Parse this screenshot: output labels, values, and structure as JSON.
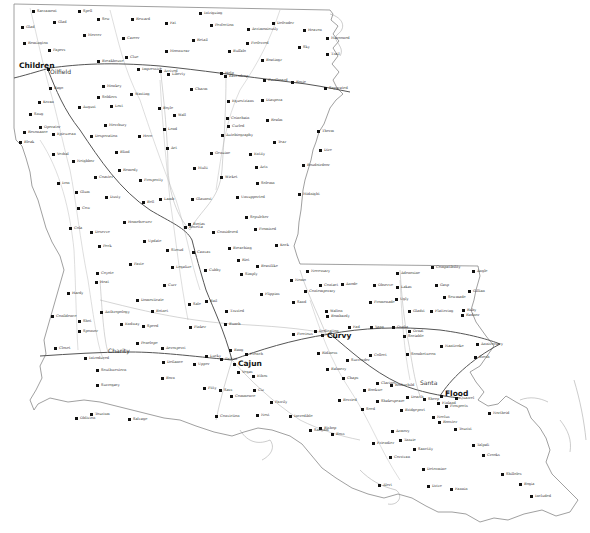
{
  "map": {
    "type": "state outline map with cities and roads",
    "colors": {
      "background": "#ffffff",
      "border": "#888888",
      "road_major": "#555555",
      "road_minor": "#bbbbbb",
      "water": "#999999",
      "dot": "#111111"
    },
    "major_cities": [
      {
        "name": "Children",
        "x": 47,
        "y": 68
      },
      {
        "name": "Curvy",
        "x": 327,
        "y": 338
      },
      {
        "name": "Cajun",
        "x": 233,
        "y": 363
      },
      {
        "name": "Flood",
        "x": 442,
        "y": 395
      }
    ],
    "medium_cities": [
      {
        "name": "Oilfield",
        "x": 50,
        "y": 72
      },
      {
        "name": "Charity",
        "x": 108,
        "y": 352
      },
      {
        "name": "Santa",
        "x": 425,
        "y": 386
      }
    ],
    "cities": [
      {
        "name": "Sacrament",
        "x": 33,
        "y": 11
      },
      {
        "name": "Spell",
        "x": 79,
        "y": 11
      },
      {
        "name": "Glad",
        "x": 54,
        "y": 22
      },
      {
        "name": "Sew",
        "x": 98,
        "y": 19
      },
      {
        "name": "Reward",
        "x": 132,
        "y": 19
      },
      {
        "name": "Fat",
        "x": 166,
        "y": 23
      },
      {
        "name": "Intriguing",
        "x": 200,
        "y": 13
      },
      {
        "name": "Perfection",
        "x": 211,
        "y": 25
      },
      {
        "name": "Acrimoniously",
        "x": 248,
        "y": 29
      },
      {
        "name": "Defender",
        "x": 273,
        "y": 23
      },
      {
        "name": "Heaven",
        "x": 304,
        "y": 30
      },
      {
        "name": "Glad",
        "x": 22,
        "y": 27
      },
      {
        "name": "Retail",
        "x": 193,
        "y": 40
      },
      {
        "name": "Marooned",
        "x": 327,
        "y": 38
      },
      {
        "name": "Remington",
        "x": 24,
        "y": 43
      },
      {
        "name": "Mercer",
        "x": 84,
        "y": 35
      },
      {
        "name": "Career",
        "x": 123,
        "y": 38
      },
      {
        "name": "Preferred",
        "x": 247,
        "y": 43
      },
      {
        "name": "Sky",
        "x": 299,
        "y": 47
      },
      {
        "name": "Trail",
        "x": 327,
        "y": 54
      },
      {
        "name": "Papers",
        "x": 49,
        "y": 50
      },
      {
        "name": "Moonwear",
        "x": 166,
        "y": 51
      },
      {
        "name": "Buffalo",
        "x": 229,
        "y": 51
      },
      {
        "name": "Boatingr",
        "x": 262,
        "y": 60
      },
      {
        "name": "Clue",
        "x": 126,
        "y": 57
      },
      {
        "name": "Breakhouse",
        "x": 98,
        "y": 61
      },
      {
        "name": "Impressive",
        "x": 138,
        "y": 69
      },
      {
        "name": "Arrived",
        "x": 160,
        "y": 71
      },
      {
        "name": "Liberty",
        "x": 168,
        "y": 74
      },
      {
        "name": "Help",
        "x": 221,
        "y": 73
      },
      {
        "name": "Eavesdrop",
        "x": 225,
        "y": 76
      },
      {
        "name": "Cardboard",
        "x": 264,
        "y": 80
      },
      {
        "name": "Rosie",
        "x": 292,
        "y": 82
      },
      {
        "name": "Separated",
        "x": 325,
        "y": 88
      },
      {
        "name": "Monkey",
        "x": 103,
        "y": 86
      },
      {
        "name": "Charm",
        "x": 191,
        "y": 89
      },
      {
        "name": "Bago",
        "x": 50,
        "y": 88
      },
      {
        "name": "Soldiers",
        "x": 98,
        "y": 97
      },
      {
        "name": "Wasting",
        "x": 131,
        "y": 94
      },
      {
        "name": "Equestrians",
        "x": 228,
        "y": 101
      },
      {
        "name": "Diaspora",
        "x": 262,
        "y": 100
      },
      {
        "name": "Koran",
        "x": 39,
        "y": 102
      },
      {
        "name": "Lost",
        "x": 111,
        "y": 106
      },
      {
        "name": "August",
        "x": 79,
        "y": 107
      },
      {
        "name": "Boyle",
        "x": 159,
        "y": 108
      },
      {
        "name": "Wall",
        "x": 174,
        "y": 115
      },
      {
        "name": "Snug",
        "x": 30,
        "y": 114
      },
      {
        "name": "Merrbury",
        "x": 105,
        "y": 125
      },
      {
        "name": "Coinchain",
        "x": 227,
        "y": 118
      },
      {
        "name": "Realm",
        "x": 267,
        "y": 120
      },
      {
        "name": "Operator",
        "x": 40,
        "y": 127
      },
      {
        "name": "Lend",
        "x": 164,
        "y": 129
      },
      {
        "name": "Curled",
        "x": 228,
        "y": 126
      },
      {
        "name": "Resonance",
        "x": 24,
        "y": 132
      },
      {
        "name": "Epicurean",
        "x": 53,
        "y": 134
      },
      {
        "name": "Desperation",
        "x": 91,
        "y": 136
      },
      {
        "name": "Hero",
        "x": 139,
        "y": 136
      },
      {
        "name": "Autobiography",
        "x": 222,
        "y": 135
      },
      {
        "name": "Tear",
        "x": 274,
        "y": 142
      },
      {
        "name": "Therm",
        "x": 318,
        "y": 131
      },
      {
        "name": "Bleak",
        "x": 20,
        "y": 142
      },
      {
        "name": "Blind",
        "x": 116,
        "y": 152
      },
      {
        "name": "Act",
        "x": 167,
        "y": 148
      },
      {
        "name": "Genuine",
        "x": 211,
        "y": 153
      },
      {
        "name": "Entity",
        "x": 250,
        "y": 154
      },
      {
        "name": "Dire",
        "x": 320,
        "y": 150
      },
      {
        "name": "Verbal",
        "x": 53,
        "y": 154
      },
      {
        "name": "Neighbor",
        "x": 73,
        "y": 161
      },
      {
        "name": "Remedy",
        "x": 119,
        "y": 170
      },
      {
        "name": "Multi",
        "x": 194,
        "y": 168
      },
      {
        "name": "Arts",
        "x": 256,
        "y": 167
      },
      {
        "name": "Boudoirdoor",
        "x": 303,
        "y": 165
      },
      {
        "name": "Coaster",
        "x": 95,
        "y": 177
      },
      {
        "name": "Prosperity",
        "x": 140,
        "y": 180
      },
      {
        "name": "Wicket",
        "x": 221,
        "y": 177
      },
      {
        "name": "Solemn",
        "x": 257,
        "y": 183
      },
      {
        "name": "Iron",
        "x": 58,
        "y": 183
      },
      {
        "name": "Glum",
        "x": 76,
        "y": 192
      },
      {
        "name": "Midnight",
        "x": 299,
        "y": 194
      },
      {
        "name": "Dusty",
        "x": 106,
        "y": 197
      },
      {
        "name": "Bell",
        "x": 143,
        "y": 202
      },
      {
        "name": "Lamb",
        "x": 160,
        "y": 199
      },
      {
        "name": "Glasnost",
        "x": 192,
        "y": 199
      },
      {
        "name": "Unsupported",
        "x": 237,
        "y": 197
      },
      {
        "name": "Cow",
        "x": 78,
        "y": 208
      },
      {
        "name": "Homebrewer",
        "x": 124,
        "y": 222
      },
      {
        "name": "Cola",
        "x": 70,
        "y": 228
      },
      {
        "name": "Deserve",
        "x": 91,
        "y": 232
      },
      {
        "name": "Sepulcher",
        "x": 246,
        "y": 217
      },
      {
        "name": "Brotas",
        "x": 189,
        "y": 224
      },
      {
        "name": "Rosetta",
        "x": 185,
        "y": 227
      },
      {
        "name": "Considered",
        "x": 213,
        "y": 232
      },
      {
        "name": "Promised",
        "x": 255,
        "y": 229
      },
      {
        "name": "Peck",
        "x": 99,
        "y": 246
      },
      {
        "name": "Update",
        "x": 144,
        "y": 241
      },
      {
        "name": "Stroud",
        "x": 167,
        "y": 250
      },
      {
        "name": "Canvas",
        "x": 193,
        "y": 252
      },
      {
        "name": "Kock",
        "x": 276,
        "y": 245
      },
      {
        "name": "Breaching",
        "x": 229,
        "y": 248
      },
      {
        "name": "Riot",
        "x": 238,
        "y": 260
      },
      {
        "name": "Legalize",
        "x": 172,
        "y": 267
      },
      {
        "name": "Paste",
        "x": 130,
        "y": 264
      },
      {
        "name": "Cubby",
        "x": 205,
        "y": 270
      },
      {
        "name": "Beastlike",
        "x": 257,
        "y": 266
      },
      {
        "name": "Simply",
        "x": 241,
        "y": 274
      },
      {
        "name": "Coyote",
        "x": 97,
        "y": 273
      },
      {
        "name": "Heat",
        "x": 96,
        "y": 282
      },
      {
        "name": "Necessary",
        "x": 307,
        "y": 271
      },
      {
        "name": "Adenosine",
        "x": 397,
        "y": 273
      },
      {
        "name": "Compatibility",
        "x": 432,
        "y": 267
      },
      {
        "name": "Angle",
        "x": 473,
        "y": 271
      },
      {
        "name": "Nemo",
        "x": 291,
        "y": 280
      },
      {
        "name": "Contact",
        "x": 320,
        "y": 285
      },
      {
        "name": "Anode",
        "x": 342,
        "y": 284
      },
      {
        "name": "Observe",
        "x": 374,
        "y": 285
      },
      {
        "name": "Lakas",
        "x": 397,
        "y": 287
      },
      {
        "name": "Gasp",
        "x": 436,
        "y": 285
      },
      {
        "name": "Curr",
        "x": 164,
        "y": 285
      },
      {
        "name": "Hardy",
        "x": 68,
        "y": 293
      },
      {
        "name": "Contemporary",
        "x": 305,
        "y": 291
      },
      {
        "name": "Flippins",
        "x": 261,
        "y": 294
      },
      {
        "name": "Sewmade",
        "x": 444,
        "y": 297
      },
      {
        "name": "Gillian",
        "x": 469,
        "y": 291
      },
      {
        "name": "Domesticate",
        "x": 137,
        "y": 300
      },
      {
        "name": "Botnet",
        "x": 152,
        "y": 311
      },
      {
        "name": "Sale",
        "x": 189,
        "y": 304
      },
      {
        "name": "Bail",
        "x": 206,
        "y": 301
      },
      {
        "name": "Anthropology",
        "x": 101,
        "y": 312
      },
      {
        "name": "Sand",
        "x": 293,
        "y": 302
      },
      {
        "name": "Promenade",
        "x": 370,
        "y": 302
      },
      {
        "name": "Ugly",
        "x": 396,
        "y": 299
      },
      {
        "name": "Gladst",
        "x": 409,
        "y": 311
      },
      {
        "name": "Flattering",
        "x": 431,
        "y": 311
      },
      {
        "name": "Ruby",
        "x": 463,
        "y": 310
      },
      {
        "name": "Radnor",
        "x": 462,
        "y": 315
      },
      {
        "name": "Confidence",
        "x": 52,
        "y": 316
      },
      {
        "name": "Shot",
        "x": 79,
        "y": 321
      },
      {
        "name": "Walton",
        "x": 326,
        "y": 311
      },
      {
        "name": "Bombardy",
        "x": 327,
        "y": 316
      },
      {
        "name": "Endway",
        "x": 121,
        "y": 324
      },
      {
        "name": "Speed",
        "x": 143,
        "y": 326
      },
      {
        "name": "Pinker",
        "x": 190,
        "y": 327
      },
      {
        "name": "Trusted",
        "x": 226,
        "y": 311
      },
      {
        "name": "Sponsor",
        "x": 79,
        "y": 331
      },
      {
        "name": "Fad",
        "x": 349,
        "y": 327
      },
      {
        "name": "Yann",
        "x": 371,
        "y": 327
      },
      {
        "name": "Osaka",
        "x": 393,
        "y": 327
      },
      {
        "name": "Ornat",
        "x": 409,
        "y": 331
      },
      {
        "name": "Bunch",
        "x": 225,
        "y": 324
      },
      {
        "name": "Precious",
        "x": 293,
        "y": 334
      },
      {
        "name": "Dedication",
        "x": 315,
        "y": 331
      },
      {
        "name": "Sociable",
        "x": 404,
        "y": 336
      },
      {
        "name": "Anniversary",
        "x": 477,
        "y": 344
      },
      {
        "name": "Nanticoke",
        "x": 441,
        "y": 346
      },
      {
        "name": "Soonbetween",
        "x": 407,
        "y": 354
      },
      {
        "name": "Penelope",
        "x": 137,
        "y": 343
      },
      {
        "name": "Aerosperri",
        "x": 162,
        "y": 348
      },
      {
        "name": "Closet",
        "x": 55,
        "y": 348
      },
      {
        "name": "Bresh",
        "x": 475,
        "y": 357
      },
      {
        "name": "Ridiness",
        "x": 318,
        "y": 353
      },
      {
        "name": "Collect",
        "x": 370,
        "y": 355
      },
      {
        "name": "Surrender",
        "x": 347,
        "y": 360
      },
      {
        "name": "Introduced",
        "x": 85,
        "y": 358
      },
      {
        "name": "Bang",
        "x": 230,
        "y": 350
      },
      {
        "name": "French",
        "x": 246,
        "y": 354
      },
      {
        "name": "Lucky",
        "x": 206,
        "y": 356
      },
      {
        "name": "Patriot",
        "x": 221,
        "y": 359
      },
      {
        "name": "Defiance",
        "x": 163,
        "y": 362
      },
      {
        "name": "Upper",
        "x": 194,
        "y": 364
      },
      {
        "name": "Southwestern",
        "x": 97,
        "y": 370
      },
      {
        "name": "Balmery",
        "x": 327,
        "y": 369
      },
      {
        "name": "Vegas",
        "x": 238,
        "y": 372
      },
      {
        "name": "Ethos",
        "x": 253,
        "y": 376
      },
      {
        "name": "Chaps",
        "x": 343,
        "y": 378
      },
      {
        "name": "Born",
        "x": 162,
        "y": 378
      },
      {
        "name": "Clarinet",
        "x": 377,
        "y": 383
      },
      {
        "name": "Bookwe",
        "x": 364,
        "y": 390
      },
      {
        "name": "Rothschild",
        "x": 391,
        "y": 385
      },
      {
        "name": "Dearth",
        "x": 407,
        "y": 397
      },
      {
        "name": "Sheep",
        "x": 424,
        "y": 399
      },
      {
        "name": "Quarrel",
        "x": 456,
        "y": 398
      },
      {
        "name": "Finland",
        "x": 438,
        "y": 403
      },
      {
        "name": "Prospects",
        "x": 446,
        "y": 406
      },
      {
        "name": "Surrogacy",
        "x": 97,
        "y": 385
      },
      {
        "name": "Pitty",
        "x": 204,
        "y": 388
      },
      {
        "name": "Sass",
        "x": 220,
        "y": 390
      },
      {
        "name": "Ciz",
        "x": 254,
        "y": 390
      },
      {
        "name": "Commence",
        "x": 231,
        "y": 396
      },
      {
        "name": "Parrily",
        "x": 271,
        "y": 402
      },
      {
        "name": "Berried",
        "x": 339,
        "y": 400
      },
      {
        "name": "Shakespeare",
        "x": 377,
        "y": 401
      },
      {
        "name": "Seed",
        "x": 362,
        "y": 409
      },
      {
        "name": "Bridgeport",
        "x": 401,
        "y": 410
      },
      {
        "name": "Northeid",
        "x": 489,
        "y": 413
      },
      {
        "name": "Conviction",
        "x": 216,
        "y": 416
      },
      {
        "name": "Nest",
        "x": 257,
        "y": 415
      },
      {
        "name": "Incredible",
        "x": 290,
        "y": 416
      },
      {
        "name": "Rooster",
        "x": 439,
        "y": 422
      },
      {
        "name": "Tourist",
        "x": 455,
        "y": 429
      },
      {
        "name": "Oblivion",
        "x": 76,
        "y": 418
      },
      {
        "name": "Tourism",
        "x": 91,
        "y": 414
      },
      {
        "name": "Salvage",
        "x": 129,
        "y": 419
      },
      {
        "name": "Sangam",
        "x": 310,
        "y": 430
      },
      {
        "name": "Bishop",
        "x": 320,
        "y": 428
      },
      {
        "name": "Boss",
        "x": 332,
        "y": 434
      },
      {
        "name": "Armory",
        "x": 392,
        "y": 431
      },
      {
        "name": "Neclus",
        "x": 433,
        "y": 417
      },
      {
        "name": "Tanzie",
        "x": 400,
        "y": 440
      },
      {
        "name": "Friendier",
        "x": 373,
        "y": 443
      },
      {
        "name": "Talpali",
        "x": 473,
        "y": 445
      },
      {
        "name": "Sanctity",
        "x": 414,
        "y": 449
      },
      {
        "name": "Corrivan",
        "x": 390,
        "y": 457
      },
      {
        "name": "Crooks",
        "x": 483,
        "y": 455
      },
      {
        "name": "Determine",
        "x": 423,
        "y": 469
      },
      {
        "name": "Shilloles",
        "x": 502,
        "y": 474
      },
      {
        "name": "Alert",
        "x": 379,
        "y": 485
      },
      {
        "name": "Drive",
        "x": 428,
        "y": 486
      },
      {
        "name": "Fannin",
        "x": 451,
        "y": 489
      },
      {
        "name": "Bogia",
        "x": 520,
        "y": 484
      },
      {
        "name": "Included",
        "x": 531,
        "y": 496
      }
    ]
  }
}
